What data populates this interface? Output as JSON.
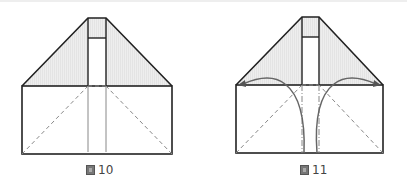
{
  "figures": [
    {
      "id": "fig10",
      "caption_glyph": "圖",
      "caption_number": "10",
      "description": "Paper folding step: trapezoid top flap with shaded triangles above rectangle with dashed diagonal fold lines and vertical center strip"
    },
    {
      "id": "fig11",
      "caption_glyph": "圖",
      "caption_number": "11",
      "description": "Paper folding step: same shape with curved arrows indicating corners folded toward center along dash-dot lines"
    }
  ],
  "colors": {
    "stroke": "#222222",
    "shade": "#e6e6e6",
    "dashed": "#888888",
    "arrow": "#666666"
  }
}
